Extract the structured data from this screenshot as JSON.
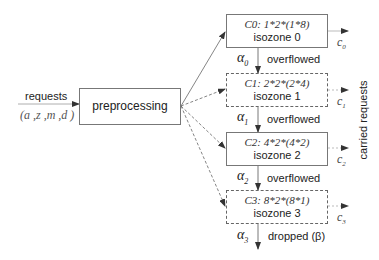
{
  "input": {
    "label": "requests",
    "tuple": "(a ,z ,m ,d )"
  },
  "preprocessing": {
    "label": "preprocessing"
  },
  "zones": [
    {
      "title": "C0: 1*2*(1*8)",
      "name": "isozone 0",
      "border": "solid",
      "carried": "c",
      "carried_sub": "0",
      "alpha": "α",
      "alpha_sub": "0",
      "flow_label": "overflowed"
    },
    {
      "title": "C1: 2*2*(2*4)",
      "name": "isozone 1",
      "border": "dashed",
      "carried": "c",
      "carried_sub": "1",
      "alpha": "α",
      "alpha_sub": "1",
      "flow_label": "overflowed"
    },
    {
      "title": "C2: 4*2*(4*2)",
      "name": "isozone 2",
      "border": "solid",
      "carried": "c",
      "carried_sub": "2",
      "alpha": "α",
      "alpha_sub": "2",
      "flow_label": "overflowed"
    },
    {
      "title": "C3: 8*2*(8*1)",
      "name": "isozone 3",
      "border": "dashed",
      "carried": "c",
      "carried_sub": "3",
      "alpha": "α",
      "alpha_sub": "3",
      "flow_label": "dropped (β)"
    }
  ],
  "carried_requests_label": "carried requests",
  "colors": {
    "line": "#555555",
    "box_border": "#777777",
    "text": "#222222"
  }
}
